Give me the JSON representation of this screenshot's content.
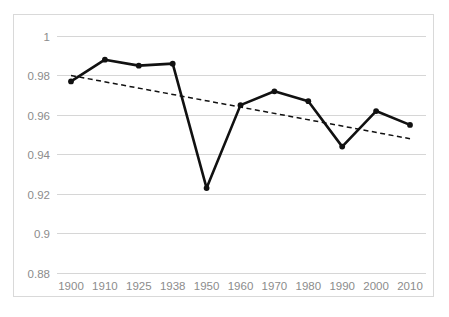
{
  "chart_data": {
    "type": "line",
    "title": "",
    "subtitle": "",
    "xlabel": "",
    "ylabel": "",
    "categories": [
      "1900",
      "1910",
      "1925",
      "1938",
      "1950",
      "1960",
      "1970",
      "1980",
      "1990",
      "2000",
      "2010"
    ],
    "series": [
      {
        "name": "value",
        "style": "solid",
        "color": "#111111",
        "markers": true,
        "values": [
          0.977,
          0.988,
          0.985,
          0.986,
          0.923,
          0.965,
          0.972,
          0.967,
          0.944,
          0.962,
          0.955
        ]
      },
      {
        "name": "trendline",
        "style": "dashed",
        "color": "#111111",
        "markers": false,
        "values": [
          0.98,
          0.9771,
          0.9727,
          0.9689,
          0.9654,
          0.9625,
          0.9596,
          0.9567,
          0.9538,
          0.9509,
          0.948
        ]
      }
    ],
    "y_ticks": [
      0.88,
      0.9,
      0.92,
      0.94,
      0.96,
      0.98,
      1
    ],
    "y_tick_labels": [
      "0.88",
      "0.9",
      "0.92",
      "0.94",
      "0.96",
      "0.98",
      "1"
    ],
    "ylim": [
      0.88,
      1.0
    ],
    "x_tick_labels": [
      "1900",
      "1910",
      "1925",
      "1938",
      "1950",
      "1960",
      "1970",
      "1980",
      "1990",
      "2000",
      "2010"
    ],
    "grid": "horizontal",
    "legend": "none",
    "gridline_color": "#d6d6d6",
    "axis_label_color": "#8c8c8c",
    "border_color": "#d9d9d9",
    "background_color": "#ffffff"
  }
}
